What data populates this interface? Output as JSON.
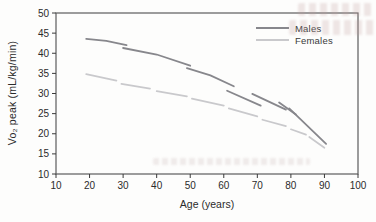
{
  "figure": {
    "background_color": "#fdfdfc",
    "frame_color": "#5d5d5d",
    "tick_color": "#3a3a3a",
    "text_color": "#2b2b2b"
  },
  "chart_data": {
    "type": "line",
    "title": "",
    "xlabel": "Age (years)",
    "ylabel": "Vo₂ peak (mL/kg/min)",
    "xlim": [
      10,
      100
    ],
    "ylim": [
      10,
      50
    ],
    "x_ticks": [
      10,
      20,
      30,
      40,
      50,
      60,
      70,
      80,
      90,
      100
    ],
    "y_ticks": [
      10,
      15,
      20,
      25,
      30,
      35,
      40,
      45,
      50
    ],
    "grid": false,
    "legend_position": "top-right-inside",
    "series": [
      {
        "name": "Males",
        "color": "#87878c",
        "width": 1.8,
        "line_style": "solid, overlapping decade segments",
        "strokes": [
          [
            [
              19,
              43.6
            ],
            [
              25,
              43.1
            ],
            [
              31,
              42.0
            ]
          ],
          [
            [
              30,
              41.3
            ],
            [
              40,
              39.7
            ],
            [
              50,
              36.9
            ]
          ],
          [
            [
              49,
              36.3
            ],
            [
              56,
              34.5
            ],
            [
              63,
              31.8
            ]
          ],
          [
            [
              61,
              30.7
            ],
            [
              71,
              27.0
            ]
          ],
          [
            [
              68.5,
              29.9
            ],
            [
              78.5,
              26.0
            ]
          ],
          [
            [
              76.5,
              27.8
            ],
            [
              81.5,
              24.8
            ]
          ],
          [
            [
              79.5,
              26.3
            ],
            [
              90.5,
              17.5
            ]
          ]
        ]
      },
      {
        "name": "Females",
        "color": "#c9c9cc",
        "width": 1.7,
        "line_style": "long-dash decade segments",
        "strokes": [
          [
            [
              19,
              34.8
            ],
            [
              28,
              33.2
            ]
          ],
          [
            [
              29.5,
              32.4
            ],
            [
              38,
              31.2
            ]
          ],
          [
            [
              40,
              30.6
            ],
            [
              49,
              29.3
            ]
          ],
          [
            [
              50.5,
              28.7
            ],
            [
              60,
              27.0
            ]
          ],
          [
            [
              61.5,
              26.3
            ],
            [
              70,
              24.3
            ]
          ],
          [
            [
              71.5,
              23.5
            ],
            [
              78.5,
              21.9
            ]
          ],
          [
            [
              80,
              21.1
            ],
            [
              84.5,
              19.8
            ]
          ],
          [
            [
              85.5,
              19.2
            ],
            [
              90,
              16.5
            ]
          ]
        ]
      }
    ]
  }
}
